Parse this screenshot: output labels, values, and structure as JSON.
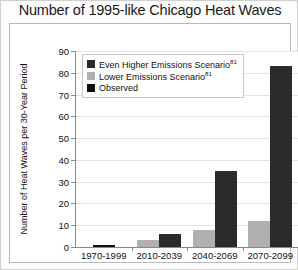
{
  "title": "Number of 1995-like Chicago Heat Waves",
  "legend": {
    "items": [
      {
        "label": "Even Higher Emissions Scenario",
        "sup": "81",
        "color": "#2b2b2b",
        "key": "higher"
      },
      {
        "label": "Lower Emissions Scenario",
        "sup": "81",
        "color": "#b0b0b0",
        "key": "lower"
      },
      {
        "label": "Observed",
        "sup": "",
        "color": "#101010",
        "key": "observed"
      }
    ]
  },
  "axis": {
    "ylabel": "Number of Heat Waves per 30-Year Period",
    "xlabel": "Years",
    "yticks": [
      0,
      10,
      20,
      30,
      40,
      50,
      60,
      70,
      80,
      90
    ]
  },
  "source": {
    "text": "Hayhoe et al.",
    "sup": "407"
  },
  "chart_data": {
    "type": "bar",
    "title": "Number of 1995-like Chicago Heat Waves",
    "xlabel": "Years",
    "ylabel": "Number of Heat Waves per 30-Year Period",
    "ylim": [
      0,
      90
    ],
    "ytick_step": 10,
    "grid": true,
    "legend_position": "top-left-inside",
    "categories": [
      "1970-1999",
      "2010-2039",
      "2040-2069",
      "2070-2099"
    ],
    "series": [
      {
        "name": "Lower Emissions Scenario",
        "color": "#b0b0b0",
        "values": [
          null,
          3,
          8,
          12
        ]
      },
      {
        "name": "Even Higher Emissions Scenario",
        "color": "#2b2b2b",
        "values": [
          null,
          6,
          35,
          83
        ]
      },
      {
        "name": "Observed",
        "color": "#101010",
        "values": [
          1,
          null,
          null,
          null
        ]
      }
    ],
    "annotations": [
      "Hayhoe et al.407"
    ]
  }
}
